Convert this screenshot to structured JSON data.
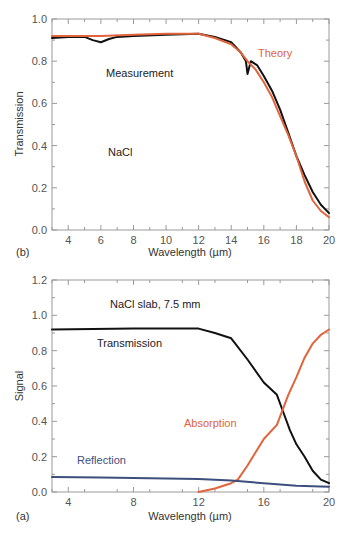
{
  "chart_data": [
    {
      "panel": "(b)",
      "type": "line",
      "xlabel": "Wavelength (µm)",
      "ylabel": "Transmission",
      "xlim": [
        3,
        20
      ],
      "ylim": [
        0.0,
        1.0
      ],
      "xticks": [
        4,
        6,
        8,
        10,
        12,
        14,
        16,
        18,
        20
      ],
      "yticks": [
        0.0,
        0.2,
        0.4,
        0.6,
        0.8,
        1.0
      ],
      "grid": false,
      "annotations": [
        "Measurement",
        "NaCl",
        "Theory"
      ],
      "series": [
        {
          "name": "Measurement",
          "color": "#111111",
          "x": [
            3,
            4,
            5,
            5.5,
            6,
            6.5,
            7,
            8,
            10,
            12,
            13,
            14,
            14.6,
            14.9,
            15.0,
            15.2,
            15.6,
            16,
            16.5,
            17,
            17.5,
            18,
            18.5,
            19,
            19.5,
            20
          ],
          "y": [
            0.91,
            0.915,
            0.915,
            0.9,
            0.89,
            0.905,
            0.915,
            0.92,
            0.925,
            0.93,
            0.915,
            0.89,
            0.84,
            0.8,
            0.74,
            0.8,
            0.78,
            0.73,
            0.66,
            0.57,
            0.46,
            0.35,
            0.26,
            0.18,
            0.12,
            0.08
          ]
        },
        {
          "name": "Theory",
          "color": "#e0643c",
          "x": [
            3,
            4,
            6,
            8,
            10,
            12,
            13,
            14,
            14.6,
            15,
            15.5,
            16,
            16.5,
            17,
            17.5,
            18,
            18.5,
            19,
            19.5,
            20
          ],
          "y": [
            0.92,
            0.92,
            0.92,
            0.925,
            0.93,
            0.93,
            0.91,
            0.88,
            0.84,
            0.8,
            0.76,
            0.7,
            0.63,
            0.54,
            0.45,
            0.35,
            0.23,
            0.14,
            0.09,
            0.06
          ]
        }
      ]
    },
    {
      "panel": "(a)",
      "type": "line",
      "title": "NaCl slab, 7.5 mm",
      "xlabel": "Wavelength (µm)",
      "ylabel": "Signal",
      "xlim": [
        3,
        20
      ],
      "ylim": [
        0.0,
        1.2
      ],
      "xticks": [
        4,
        8,
        12,
        16,
        20
      ],
      "yticks": [
        0.0,
        0.2,
        0.4,
        0.6,
        0.8,
        1.0,
        1.2
      ],
      "grid": false,
      "annotations": [
        "NaCl slab, 7.5 mm",
        "Transmission",
        "Absorption",
        "Reflection"
      ],
      "series": [
        {
          "name": "Transmission",
          "color": "#111111",
          "x": [
            3,
            8,
            12,
            13,
            14,
            15,
            16,
            16.8,
            17.2,
            17.6,
            18,
            18.5,
            19,
            19.5,
            20
          ],
          "y": [
            0.92,
            0.925,
            0.925,
            0.9,
            0.87,
            0.75,
            0.62,
            0.55,
            0.45,
            0.35,
            0.27,
            0.2,
            0.12,
            0.07,
            0.05
          ]
        },
        {
          "name": "Absorption",
          "color": "#e0643c",
          "x": [
            12,
            13,
            14,
            14.4,
            15,
            16,
            16.8,
            17.5,
            18,
            18.5,
            19,
            19.5,
            20
          ],
          "y": [
            0.0,
            0.02,
            0.05,
            0.07,
            0.15,
            0.3,
            0.38,
            0.55,
            0.65,
            0.76,
            0.84,
            0.89,
            0.92
          ]
        },
        {
          "name": "Reflection",
          "color": "#3d4f7c",
          "x": [
            3,
            6,
            8,
            10,
            12,
            14,
            16,
            18,
            20
          ],
          "y": [
            0.085,
            0.082,
            0.08,
            0.077,
            0.074,
            0.065,
            0.05,
            0.035,
            0.03
          ]
        }
      ]
    }
  ],
  "panels": {
    "b": {
      "label": "(b)",
      "xlabel": "Wavelength (µm)",
      "ylabel": "Transmission",
      "measurement_label": "Measurement",
      "material_label": "NaCl",
      "theory_label": "Theory",
      "xtick_labels": [
        "4",
        "6",
        "8",
        "10",
        "12",
        "14",
        "16",
        "18",
        "20"
      ],
      "ytick_labels": [
        "0.0",
        "0.2",
        "0.4",
        "0.6",
        "0.8",
        "1.0"
      ]
    },
    "a": {
      "label": "(a)",
      "xlabel": "Wavelength (µm)",
      "ylabel": "Signal",
      "title_label": "NaCl slab, 7.5 mm",
      "transmission_label": "Transmission",
      "absorption_label": "Absorption",
      "reflection_label": "Reflection",
      "xtick_labels": [
        "4",
        "8",
        "12",
        "16",
        "20"
      ],
      "ytick_labels": [
        "0.0",
        "0.2",
        "0.4",
        "0.6",
        "0.8",
        "1.0",
        "1.2"
      ]
    }
  },
  "colors": {
    "black_series": "#111111",
    "orange_series": "#e0643c",
    "blue_series": "#3d4f7c",
    "axis": "#888888"
  }
}
